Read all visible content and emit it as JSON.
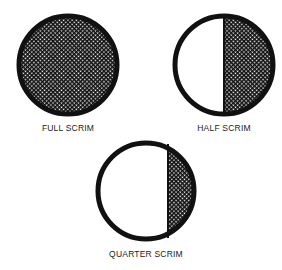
{
  "diagram": {
    "colors": {
      "ink": "#111111",
      "background": "#ffffff"
    },
    "items": [
      {
        "label": "FULL SCRIM",
        "coverage": "full",
        "cx": 68,
        "cy": 65,
        "r": 49
      },
      {
        "label": "HALF SCRIM",
        "coverage": "half",
        "cx": 224,
        "cy": 65,
        "r": 49
      },
      {
        "label": "QUARTER SCRIM",
        "coverage": "quarter",
        "cx": 146,
        "cy": 191,
        "r": 48
      }
    ]
  }
}
